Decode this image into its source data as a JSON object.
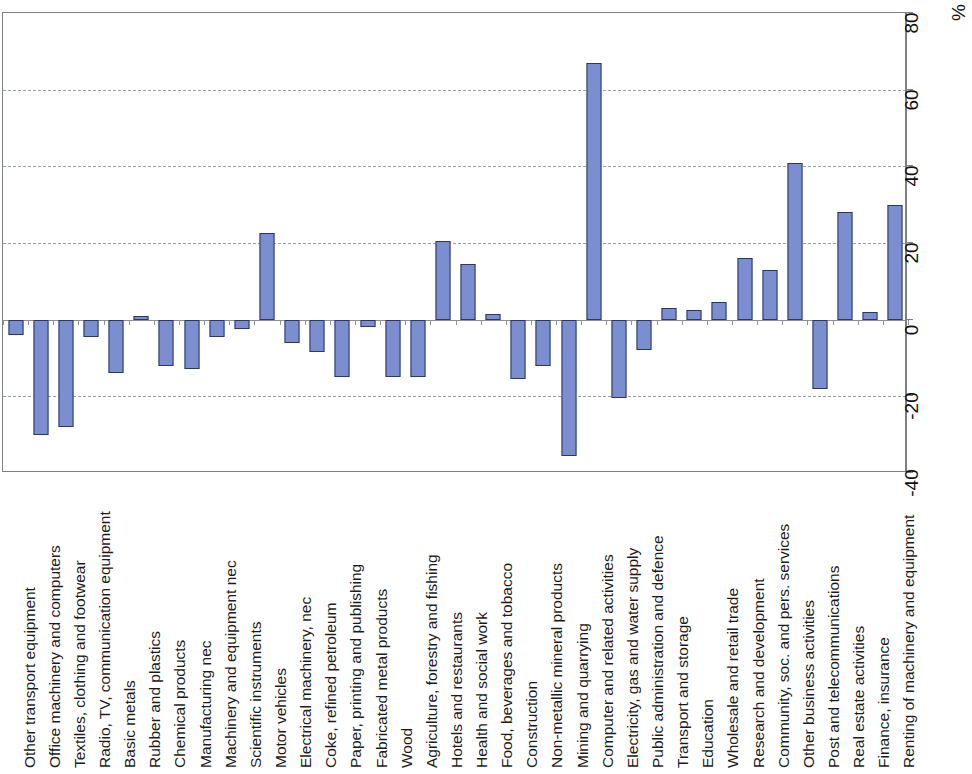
{
  "chart_data": {
    "type": "bar",
    "title": "",
    "subtitle": "",
    "xlabel": "",
    "ylabel": "%",
    "ylim": [
      -40,
      80
    ],
    "yticks": [
      -40,
      -20,
      0,
      20,
      40,
      60,
      80
    ],
    "ytick_labels": [
      "-40",
      "-20",
      "0",
      "20",
      "40",
      "60",
      "80"
    ],
    "grid": true,
    "gridlines_at": [
      -20,
      20,
      40,
      60
    ],
    "legend": null,
    "orientation": "vertical",
    "bar_color": "#7b8fd0",
    "bar_border_color": "#2b3664",
    "categories": [
      "Other transport equipment",
      "Office machinery and computers",
      "Textiles, clothing and footwear",
      "Radio, TV, communication equipment",
      "Basic metals",
      "Rubber and plastics",
      "Chemical products",
      "Manufacturing nec",
      "Machinery and equipment nec",
      "Scientific instruments",
      "Motor vehicles",
      "Electrical machinery, nec",
      "Coke, refined petroleum",
      "Paper, printing and publishing",
      "Fabricated metal products",
      "Wood",
      "Agriculture, forestry and fishing",
      "Hotels and restaurants",
      "Health and social work",
      "Food, beverages and tobacco",
      "Construction",
      "Non-metallic mineral products",
      "Mining and quarrying",
      "Computer and related activities",
      "Electricity, gas and water supply",
      "Public administration and defence",
      "Transport and storage",
      "Education",
      "Wholesale and retail trade",
      "Research and development",
      "Community, soc. and pers. services",
      "Other business activities",
      "Post and telecommunications",
      "Real estate activities",
      "Finance, insurance",
      "Renting of machinery and equipment"
    ],
    "values": [
      -4,
      -30,
      -28,
      -4.5,
      -14,
      1,
      -12,
      -13,
      -4.5,
      -2.5,
      22.5,
      -6,
      -8.5,
      -15,
      -2,
      -15,
      -15,
      20.5,
      14.5,
      1.5,
      -15.5,
      -12,
      -35.5,
      67,
      -20.5,
      -8,
      3,
      2.5,
      4.5,
      16,
      13,
      41,
      -18,
      28,
      2,
      30
    ]
  },
  "axis": {
    "unit_label": "%"
  }
}
